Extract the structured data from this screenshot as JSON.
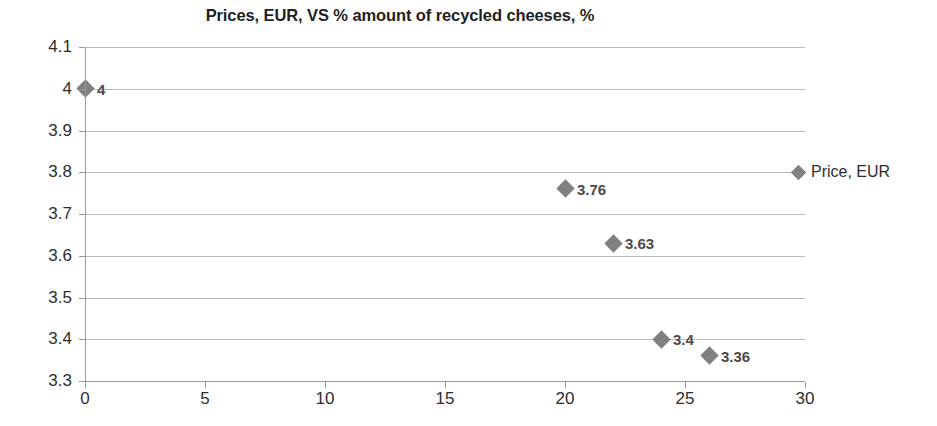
{
  "chart_data": {
    "type": "scatter",
    "title": "Prices, EUR, VS % amount of recycled cheeses, %",
    "xlabel": "",
    "ylabel": "",
    "xlim": [
      0,
      30
    ],
    "ylim": [
      3.3,
      4.1
    ],
    "xticks": [
      "0",
      "5",
      "10",
      "15",
      "20",
      "25",
      "30"
    ],
    "xtick_values": [
      0,
      5,
      10,
      15,
      20,
      25,
      30
    ],
    "yticks": [
      "3.3",
      "3.4",
      "3.5",
      "3.6",
      "3.7",
      "3.8",
      "3.9",
      "4",
      "4.1"
    ],
    "ytick_values": [
      3.3,
      3.4,
      3.5,
      3.6,
      3.7,
      3.8,
      3.9,
      4.0,
      4.1
    ],
    "grid": "horizontal",
    "legend_position": "right",
    "marker": "diamond",
    "marker_color": "#808080",
    "gridline_color": "#b9b9b9",
    "axis_color": "#9a9a9a",
    "series": [
      {
        "name": "Price, EUR",
        "points": [
          {
            "x": 0,
            "y": 4,
            "label": "4"
          },
          {
            "x": 20,
            "y": 3.76,
            "label": "3.76"
          },
          {
            "x": 22,
            "y": 3.63,
            "label": "3.63"
          },
          {
            "x": 24,
            "y": 3.4,
            "label": "3.4"
          },
          {
            "x": 26,
            "y": 3.36,
            "label": "3.36"
          }
        ]
      }
    ]
  },
  "legend": {
    "entries": [
      {
        "label": "Price, EUR"
      }
    ]
  }
}
